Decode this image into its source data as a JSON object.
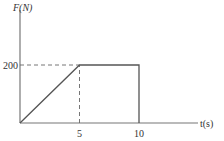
{
  "chart_data": {
    "type": "line",
    "title": "",
    "xlabel": "t(s)",
    "ylabel": "F(N)",
    "x": [
      0,
      5,
      10,
      10
    ],
    "series": [
      {
        "name": "F(t)",
        "values": [
          0,
          200,
          200,
          0
        ]
      }
    ],
    "xticks": [
      {
        "value": 5,
        "label": "5"
      },
      {
        "value": 10,
        "label": "10"
      }
    ],
    "yticks": [
      {
        "value": 200,
        "label": "200"
      }
    ],
    "guides": [
      {
        "type": "horizontal-dashed",
        "from_x": 0,
        "to_x": 5,
        "y": 200
      },
      {
        "type": "vertical-dashed",
        "x": 5,
        "from_y": 0,
        "to_y": 200
      }
    ],
    "xlim": [
      0,
      15
    ],
    "ylim": [
      0,
      350
    ],
    "grid": false,
    "legend": "none"
  }
}
